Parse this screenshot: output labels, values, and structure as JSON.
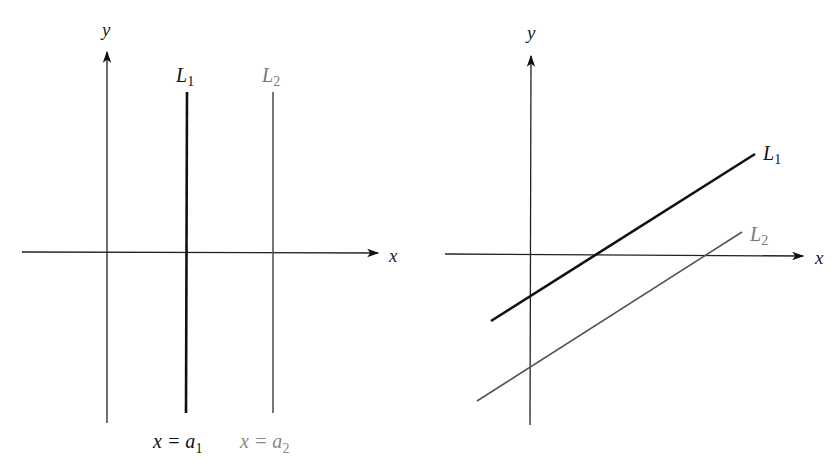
{
  "colors": {
    "background": "#ffffff",
    "primary_line": "#111111",
    "secondary_line": "#555555",
    "secondary_text": "#777777"
  },
  "left_panel": {
    "x_axis_label": "x",
    "y_axis_label": "y",
    "lines": [
      {
        "name": "L",
        "subscript": "1",
        "equation_lhs": "x = a",
        "equation_subscript": "1",
        "style": "thick-black"
      },
      {
        "name": "L",
        "subscript": "2",
        "equation_lhs": "x = a",
        "equation_subscript": "2",
        "style": "thin-gray"
      }
    ]
  },
  "right_panel": {
    "x_axis_label": "x",
    "y_axis_label": "y",
    "lines": [
      {
        "name": "L",
        "subscript": "1",
        "style": "thick-black"
      },
      {
        "name": "L",
        "subscript": "2",
        "style": "thin-gray"
      }
    ]
  }
}
